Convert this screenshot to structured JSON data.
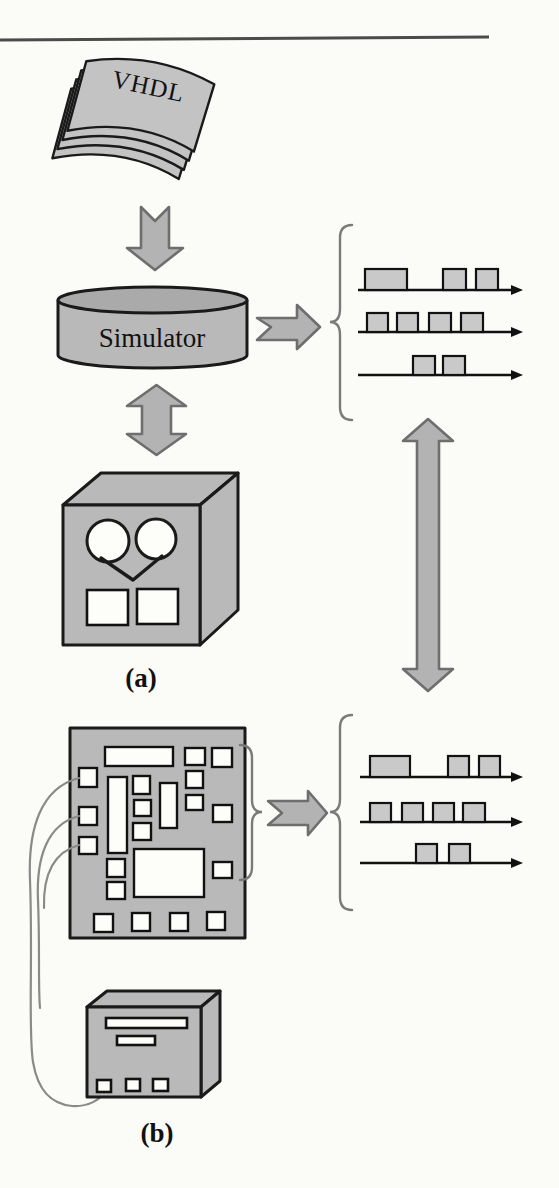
{
  "figure": {
    "labels": {
      "source": "VHDL",
      "simulator": "Simulator",
      "part_a": "(a)",
      "part_b": "(b)"
    },
    "colors": {
      "shape_fill": "#b9b9b9",
      "outline": "#1a1a1a",
      "arrow_fill": "#b3b3b3",
      "arrow_outline": "#6e6e6e",
      "pulse_fill": "#c9c9c9",
      "wire": "#8a8a8a",
      "background": "#fbfbf8"
    },
    "icons": {
      "vhdl_stack": "stack-of-vhdl-source-pages",
      "simulator": "simulator-disk-cylinder",
      "tape_computer": "tape-reel-computer-box",
      "circuit_board": "printed-circuit-board",
      "instrument": "test-instrument-box"
    }
  },
  "waveform_sets": [
    {
      "name": "simulated-waveforms",
      "x": 358,
      "tracks": [
        {
          "y": 290,
          "len": 165,
          "h": 21,
          "pulses": [
            [
              7,
              49
            ],
            [
              85,
              108
            ],
            [
              118,
              140
            ]
          ]
        },
        {
          "y": 332,
          "len": 165,
          "h": 19,
          "pulses": [
            [
              9,
              30
            ],
            [
              39,
              60
            ],
            [
              71,
              93
            ],
            [
              103,
              125
            ]
          ]
        },
        {
          "y": 375,
          "len": 165,
          "h": 19,
          "pulses": [
            [
              55,
              77
            ],
            [
              85,
              107
            ]
          ]
        }
      ]
    },
    {
      "name": "measured-waveforms",
      "x": 360,
      "tracks": [
        {
          "y": 777,
          "len": 163,
          "h": 21,
          "pulses": [
            [
              10,
              50
            ],
            [
              88,
              109
            ],
            [
              119,
              140
            ]
          ]
        },
        {
          "y": 822,
          "len": 163,
          "h": 19,
          "pulses": [
            [
              10,
              31
            ],
            [
              42,
              63
            ],
            [
              73,
              94
            ],
            [
              103,
              125
            ]
          ]
        },
        {
          "y": 863,
          "len": 163,
          "h": 19,
          "pulses": [
            [
              56,
              77
            ],
            [
              89,
              110
            ]
          ]
        }
      ]
    }
  ]
}
